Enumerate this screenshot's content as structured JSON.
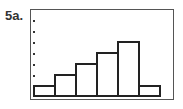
{
  "label": "5a.",
  "chart_data": {
    "type": "bar",
    "title": "",
    "xlabel": "",
    "ylabel": "",
    "categories": [
      "1",
      "2",
      "3",
      "4",
      "5",
      "6"
    ],
    "values": [
      1,
      2,
      3,
      4,
      5,
      1
    ],
    "ylim": [
      0,
      8
    ],
    "grid": false,
    "legend": null,
    "y_tick_marks": 7,
    "style": "histogram, calculator-screen frame, dotted y-axis ticks"
  }
}
